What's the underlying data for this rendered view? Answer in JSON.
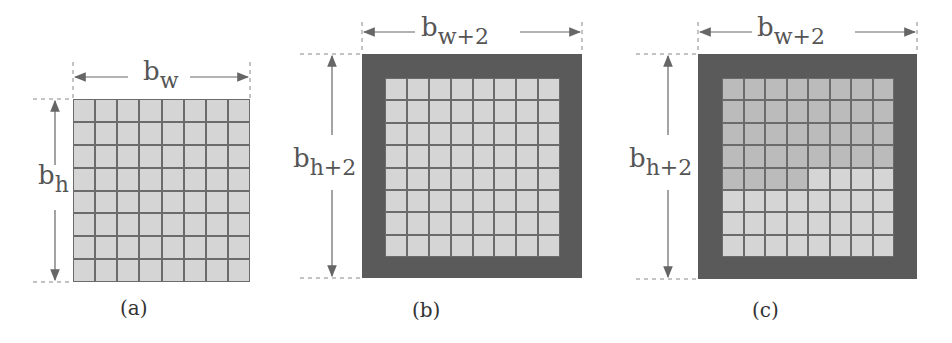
{
  "panels": [
    {
      "id": "a",
      "caption": "(a)",
      "width_label": {
        "base": "b",
        "sub": "w"
      },
      "height_label": {
        "base": "b",
        "sub": "h"
      },
      "border": false,
      "dark_cells": []
    },
    {
      "id": "b",
      "caption": "(b)",
      "width_label": {
        "base": "b",
        "sub": "w+2"
      },
      "height_label": {
        "base": "b",
        "sub": "h+2"
      },
      "border": true,
      "dark_cells": []
    },
    {
      "id": "c",
      "caption": "(c)",
      "width_label": {
        "base": "b",
        "sub": "w+2"
      },
      "height_label": {
        "base": "b",
        "sub": "h+2"
      },
      "border": true,
      "dark_cells_desc": "rows 0-3 all columns, row 4 columns 0-3"
    }
  ],
  "grid": {
    "rows": 8,
    "cols": 8
  },
  "colors": {
    "cell": "#d5d5d5",
    "cell_dark": "#bbbbbb",
    "grid_line": "#6b6b6b",
    "border": "#5a5a5a"
  }
}
